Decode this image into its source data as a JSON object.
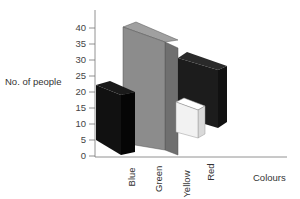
{
  "chart_data": {
    "type": "bar",
    "style": "3d",
    "title": "",
    "xlabel": "Colours",
    "ylabel": "No. of people",
    "categories": [
      "Blue",
      "Green",
      "Yellow",
      "Red"
    ],
    "values": [
      20,
      38,
      6,
      18
    ],
    "bar_colors": [
      "#111111",
      "#8c8c8c",
      "#f2f2f2",
      "#1a1a1a"
    ],
    "ylim": [
      0,
      40
    ],
    "yticks": [
      "0",
      "5",
      "10",
      "15",
      "20",
      "25",
      "30",
      "35",
      "40"
    ],
    "grid": false,
    "legend": null
  }
}
